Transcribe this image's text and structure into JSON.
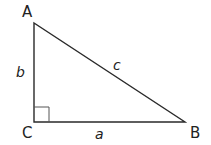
{
  "diagram": {
    "type": "right-triangle",
    "vertices": [
      {
        "name": "A",
        "x": 34,
        "y": 23,
        "label_x": 22,
        "label_y": 17
      },
      {
        "name": "C",
        "x": 34,
        "y": 122,
        "label_x": 22,
        "label_y": 138
      },
      {
        "name": "B",
        "x": 185,
        "y": 122,
        "label_x": 190,
        "label_y": 138
      }
    ],
    "sides": [
      {
        "name": "b",
        "between": "A-C",
        "label_x": 16,
        "label_y": 77
      },
      {
        "name": "c",
        "between": "A-B",
        "label_x": 113,
        "label_y": 70
      },
      {
        "name": "a",
        "between": "C-B",
        "label_x": 95,
        "label_y": 139
      }
    ],
    "right_angle_at": "C",
    "right_angle_size": 15,
    "line_color": "#2a2a2a"
  }
}
